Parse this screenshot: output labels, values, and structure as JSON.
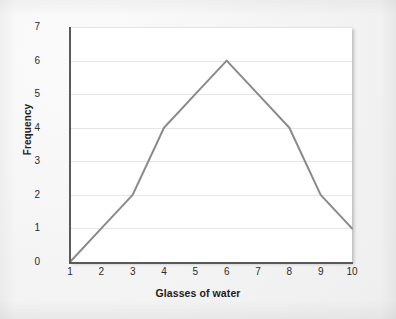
{
  "chart_data": {
    "type": "line",
    "title": "",
    "subtitle": "",
    "xlabel": "Glasses of water",
    "ylabel": "Frequency",
    "x": [
      1,
      2,
      3,
      4,
      5,
      6,
      7,
      8,
      9,
      10
    ],
    "values": [
      0,
      1,
      2,
      4,
      5,
      6,
      5,
      4,
      2,
      1
    ],
    "categories": [
      "1",
      "2",
      "3",
      "4",
      "5",
      "6",
      "7",
      "8",
      "9",
      "10"
    ],
    "xtick_labels": [
      "1",
      "2",
      "3",
      "4",
      "5",
      "6",
      "7",
      "8",
      "9",
      "10"
    ],
    "ytick_labels": [
      "0",
      "1",
      "2",
      "3",
      "4",
      "5",
      "6",
      "7"
    ],
    "ytick_values": [
      0,
      1,
      2,
      3,
      4,
      5,
      6,
      7
    ],
    "xlim": [
      1,
      10
    ],
    "ylim": [
      0,
      7
    ],
    "grid": "horizontal",
    "legend": "none",
    "annotations": [],
    "series": [
      {
        "name": "Frequency",
        "values": [
          0,
          1,
          2,
          4,
          5,
          6,
          5,
          4,
          2,
          1
        ]
      }
    ],
    "colors": {
      "line": "#8a8a8a",
      "gridline": "#e6e6e6",
      "axis": "#5a5a5a",
      "text": "#1d1d1d",
      "tick_text": "#2b2b2b",
      "plot_background": "#ffffff",
      "page_background": "#f2f2f2"
    }
  }
}
